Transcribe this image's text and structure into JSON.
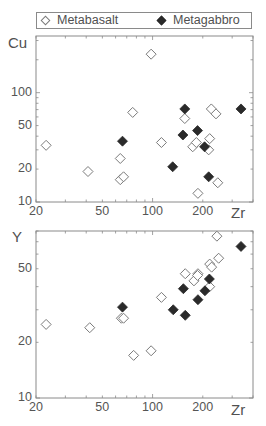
{
  "legend": {
    "items": [
      {
        "label": "Metabasalt",
        "marker": "open-diamond"
      },
      {
        "label": "Metagabbro",
        "marker": "filled-diamond"
      }
    ]
  },
  "colors": {
    "axis": "#8a8a8a",
    "open_marker_stroke": "#7a7a7a",
    "filled_marker": "#2a2a2a",
    "text": "#505050"
  },
  "chart_data": [
    {
      "type": "scatter",
      "title": "",
      "xlabel": "Zr",
      "ylabel": "Cu",
      "xscale": "log",
      "yscale": "log",
      "xlim": [
        20,
        400
      ],
      "ylim": [
        10,
        330
      ],
      "grid": false,
      "legend_position": "top",
      "x_ticks": [
        20,
        50,
        100,
        200
      ],
      "y_ticks": [
        10,
        20,
        50,
        100
      ],
      "series": [
        {
          "name": "Metabasalt",
          "marker": "open-diamond",
          "points": [
            [
              23,
              33
            ],
            [
              41,
              19
            ],
            [
              98,
              225
            ],
            [
              76,
              66
            ],
            [
              64,
              25
            ],
            [
              64,
              16
            ],
            [
              67,
              17
            ],
            [
              113,
              35
            ],
            [
              156,
              58
            ],
            [
              174,
              32
            ],
            [
              183,
              35
            ],
            [
              217,
              30
            ],
            [
              220,
              38
            ],
            [
              225,
              71
            ],
            [
              240,
              64
            ],
            [
              187,
              12
            ],
            [
              246,
              15
            ]
          ]
        },
        {
          "name": "Metagabbro",
          "marker": "filled-diamond",
          "points": [
            [
              66,
              36
            ],
            [
              156,
              71
            ],
            [
              152,
              41
            ],
            [
              186,
              45
            ],
            [
              205,
              32
            ],
            [
              132,
              21
            ],
            [
              217,
              17
            ],
            [
              339,
              71
            ]
          ]
        }
      ]
    },
    {
      "type": "scatter",
      "title": "",
      "xlabel": "Zr",
      "ylabel": "Y",
      "xscale": "log",
      "yscale": "log",
      "xlim": [
        20,
        400
      ],
      "ylim": [
        10,
        80
      ],
      "grid": false,
      "x_ticks": [
        20,
        50,
        100,
        200
      ],
      "y_ticks": [
        10,
        20,
        50
      ],
      "series": [
        {
          "name": "Metabasalt",
          "marker": "open-diamond",
          "points": [
            [
              23,
              25
            ],
            [
              42,
              24
            ],
            [
              65,
              27
            ],
            [
              67,
              27
            ],
            [
              77,
              17
            ],
            [
              98,
              18
            ],
            [
              113,
              35
            ],
            [
              157,
              47
            ],
            [
              177,
              43
            ],
            [
              187,
              47
            ],
            [
              186,
              46
            ],
            [
              220,
              53
            ],
            [
              226,
              51
            ],
            [
              249,
              57
            ],
            [
              243,
              75
            ],
            [
              220,
              40
            ]
          ]
        },
        {
          "name": "Metagabbro",
          "marker": "filled-diamond",
          "points": [
            [
              66,
              31
            ],
            [
              133,
              30
            ],
            [
              157,
              28
            ],
            [
              153,
              39
            ],
            [
              187,
              34
            ],
            [
              206,
              38
            ],
            [
              219,
              44
            ],
            [
              339,
              66
            ]
          ]
        }
      ]
    }
  ]
}
